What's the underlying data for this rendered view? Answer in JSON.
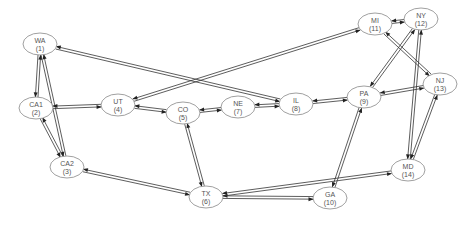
{
  "diagram": {
    "type": "directed network graph",
    "colors": {
      "edge": "#333333",
      "node_stroke": "#888888",
      "label": "#555555",
      "background": "#ffffff"
    },
    "nodes": [
      {
        "id": 1,
        "name": "WA",
        "index_label": "(1)",
        "x": 40,
        "y": 44
      },
      {
        "id": 2,
        "name": "CA1",
        "index_label": "(2)",
        "x": 36,
        "y": 108
      },
      {
        "id": 3,
        "name": "CA2",
        "index_label": "(3)",
        "x": 67,
        "y": 167
      },
      {
        "id": 4,
        "name": "UT",
        "index_label": "(4)",
        "x": 118,
        "y": 105
      },
      {
        "id": 5,
        "name": "CO",
        "index_label": "(5)",
        "x": 183,
        "y": 113
      },
      {
        "id": 6,
        "name": "TX",
        "index_label": "(6)",
        "x": 206,
        "y": 197
      },
      {
        "id": 7,
        "name": "NE",
        "index_label": "(7)",
        "x": 238,
        "y": 107
      },
      {
        "id": 8,
        "name": "IL",
        "index_label": "(8)",
        "x": 296,
        "y": 104
      },
      {
        "id": 9,
        "name": "PA",
        "index_label": "(9)",
        "x": 364,
        "y": 97
      },
      {
        "id": 10,
        "name": "GA",
        "index_label": "(10)",
        "x": 330,
        "y": 198
      },
      {
        "id": 11,
        "name": "MI",
        "index_label": "(11)",
        "x": 375,
        "y": 24
      },
      {
        "id": 12,
        "name": "NY",
        "index_label": "(12)",
        "x": 421,
        "y": 19
      },
      {
        "id": 13,
        "name": "NJ",
        "index_label": "(13)",
        "x": 440,
        "y": 84
      },
      {
        "id": 14,
        "name": "MD",
        "index_label": "(14)",
        "x": 408,
        "y": 170
      }
    ],
    "edges": [
      [
        1,
        2
      ],
      [
        1,
        3
      ],
      [
        1,
        8
      ],
      [
        2,
        4
      ],
      [
        2,
        3
      ],
      [
        3,
        6
      ],
      [
        4,
        11
      ],
      [
        4,
        5
      ],
      [
        5,
        7
      ],
      [
        5,
        6
      ],
      [
        7,
        8
      ],
      [
        8,
        9
      ],
      [
        9,
        12
      ],
      [
        9,
        13
      ],
      [
        9,
        10
      ],
      [
        6,
        10
      ],
      [
        6,
        14
      ],
      [
        11,
        12
      ],
      [
        11,
        13
      ],
      [
        12,
        14
      ],
      [
        13,
        14
      ]
    ],
    "edge_style": "bidirectional pair of parallel arrows"
  }
}
